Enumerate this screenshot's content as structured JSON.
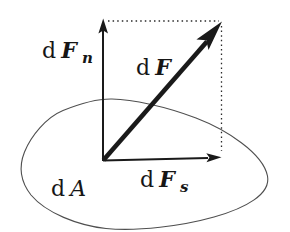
{
  "colors": {
    "ink": "#1a1a1a",
    "surface_outline": "#4f4f4f",
    "background": "#ffffff"
  },
  "labels": {
    "normal_force": {
      "prefix": "d",
      "symbol": "F",
      "subscript": "n"
    },
    "resultant_force": {
      "prefix": "d",
      "symbol": "F"
    },
    "shear_force": {
      "prefix": "d",
      "symbol": "F",
      "subscript": "s"
    },
    "surface_area": {
      "prefix": "d",
      "symbol": "A"
    }
  }
}
